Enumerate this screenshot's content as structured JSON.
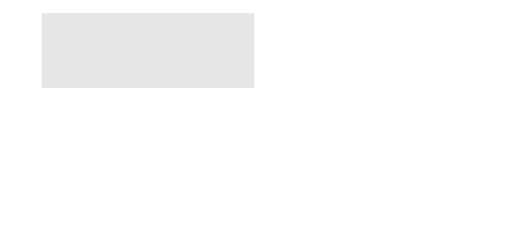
{
  "diagram": {
    "type": "4-bit binary counter with enable using T flip-flops",
    "inputs": {
      "enable": "E",
      "clear": "Clear",
      "clock": "Clk"
    },
    "flip_flops": [
      {
        "name": "FF",
        "index": "3",
        "t": "T",
        "q": "Q",
        "qn": "Q",
        "sub": "3"
      },
      {
        "name": "FF",
        "index": "2",
        "t": "T",
        "q": "Q",
        "qn": "Q",
        "sub": "2"
      },
      {
        "name": "FF",
        "index": "1",
        "t": "T",
        "q": "Q",
        "qn": "Q",
        "sub": "1"
      },
      {
        "name": "FF",
        "index": "0",
        "t": "T",
        "q": "Q",
        "qn": "Q",
        "sub": "0"
      }
    ],
    "outputs": [
      {
        "label": "Q",
        "sub": "3"
      },
      {
        "label": "Q",
        "sub": "2"
      },
      {
        "label": "Q",
        "sub": "1"
      },
      {
        "label": "Q",
        "sub": "0"
      }
    ],
    "colors": {
      "panel": "#e6e6e6",
      "wire": "#444444",
      "box_fill": "#ffffff"
    }
  }
}
